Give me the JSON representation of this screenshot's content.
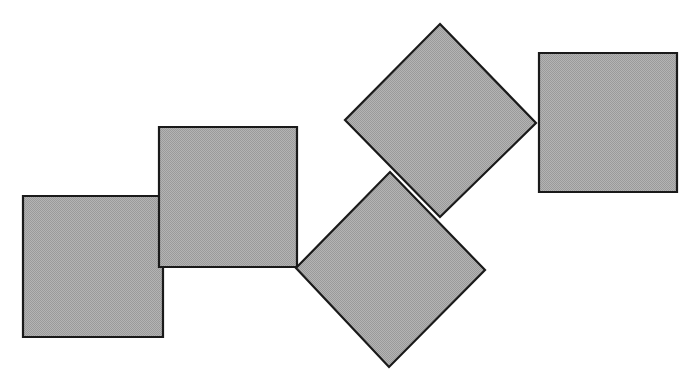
{
  "canvas": {
    "width": 696,
    "height": 386,
    "background_color": "#ffffff",
    "title": "Chain of five congruent squares"
  },
  "style": {
    "fill_color": "#a9a9a9",
    "fill_pattern": "dithered-gray-halftone",
    "stroke_color": "#1a1a1a",
    "stroke_width": 2.2
  },
  "figure_data": {
    "type": "diagram",
    "description": "Five congruent shaded squares arranged in a zig-zag chain; three are axis-aligned and two are rotated approximately 45 degrees (diamonds). Adjacent squares meet at single corner points or overlap slightly.",
    "shape_count": 5,
    "shapes": [
      {
        "id": "square-1",
        "label": "Square 1",
        "orientation": "axis-aligned",
        "rotation_deg": 0,
        "side_length": 140,
        "center": [
          93,
          266
        ],
        "points": "23,196 163,196 163,337 23,337"
      },
      {
        "id": "square-2",
        "label": "Square 2",
        "orientation": "axis-aligned",
        "rotation_deg": 0,
        "side_length": 139,
        "center": [
          228,
          197
        ],
        "points": "159,127 297,127 297,267 159,267"
      },
      {
        "id": "square-3",
        "label": "Square 3",
        "orientation": "rotated-diamond",
        "rotation_deg": 45,
        "side_length": 136,
        "center": [
          390,
          270
        ],
        "points": "296,268 390,172 485,270 389,367"
      },
      {
        "id": "square-4",
        "label": "Square 4",
        "orientation": "rotated-diamond",
        "rotation_deg": 45,
        "side_length": 135,
        "center": [
          440,
          121
        ],
        "points": "440,24 536,123 440,217 345,120"
      },
      {
        "id": "square-5",
        "label": "Square 5",
        "orientation": "axis-aligned",
        "rotation_deg": 0,
        "side_length": 139,
        "center": [
          608,
          123
        ],
        "points": "539,53 677,53 677,192 539,192"
      }
    ],
    "draw_order": [
      "square-1",
      "square-2",
      "square-4",
      "square-3",
      "square-5"
    ]
  }
}
